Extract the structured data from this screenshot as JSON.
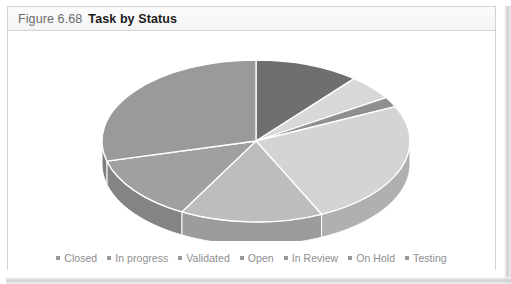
{
  "figure": {
    "number": "Figure 6.68",
    "title": "Task by Status"
  },
  "colors": {
    "panel_border": "#d2d2d2",
    "title_text": "#1c1c1c",
    "number_text": "#6d6d6d",
    "legend_text": "#8e8e8e",
    "slice_separator": "#ffffff",
    "background": "#ffffff"
  },
  "chart_data": {
    "type": "pie",
    "title": "Task by Status",
    "three_d": true,
    "legend_position": "bottom",
    "labels": [
      "Closed",
      "In progress",
      "Validated",
      "Open",
      "In Review",
      "On Hold",
      "Testing"
    ],
    "values": [
      11,
      5,
      2,
      25,
      15,
      13,
      29
    ],
    "percentages": [
      "11%",
      "5%",
      "2%",
      "25%",
      "15%",
      "13%",
      "29%"
    ],
    "slice_colors": [
      "#6f6f6f",
      "#d8d8d8",
      "#8f8f8f",
      "#d4d4d4",
      "#bdbdbd",
      "#a0a0a0",
      "#9a9a9a"
    ],
    "side_colors": [
      "#5a5a5a",
      "#b4b4b4",
      "#767676",
      "#b0b0b0",
      "#9c9c9c",
      "#848484",
      "#7f7f7f"
    ],
    "start_angle_deg": 90,
    "direction": "clockwise"
  },
  "legend": {
    "items": [
      {
        "label": "Closed",
        "color": "#9a9a9a"
      },
      {
        "label": "In progress",
        "color": "#9a9a9a"
      },
      {
        "label": "Validated",
        "color": "#9a9a9a"
      },
      {
        "label": "Open",
        "color": "#9a9a9a"
      },
      {
        "label": "In Review",
        "color": "#9a9a9a"
      },
      {
        "label": "On Hold",
        "color": "#9a9a9a"
      },
      {
        "label": "Testing",
        "color": "#9a9a9a"
      }
    ]
  }
}
